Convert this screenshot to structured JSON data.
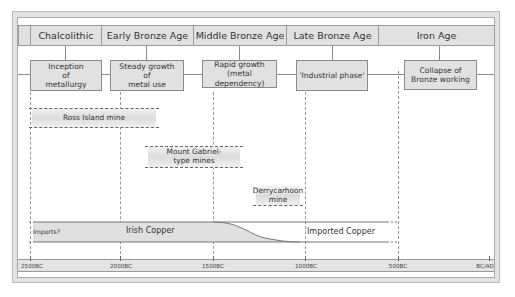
{
  "periods": [
    {
      "label": "Chalcolithic"
    },
    {
      "label": "Early Bronze Age"
    },
    {
      "label": "Middle Bronze Age"
    },
    {
      "label": "Late Bronze Age"
    },
    {
      "label": "Iron Age"
    }
  ],
  "phases": [
    {
      "label": "Inception\nof\nmetallurgy"
    },
    {
      "label": "Steady growth\nof\nmetal use"
    },
    {
      "label": "Rapid growth\n(metal dependency)"
    },
    {
      "label": "'Industrial phase'"
    },
    {
      "label": "Collapse of\nBronze working"
    }
  ],
  "mines": [
    {
      "label": "Ross Island mine"
    },
    {
      "label": "Mount Gabriel-\ntype mines"
    },
    {
      "label": "Derrycarhoon\nmine"
    }
  ],
  "copper": {
    "imports_label": "Imports?",
    "irish_label": "Irish Copper",
    "imported_label": "Imported Copper"
  },
  "axis": {
    "ticks": [
      "2500BC",
      "2000BC",
      "1500BC",
      "1000BC",
      "500BC",
      "BC/AD"
    ]
  },
  "colors": {
    "box_fill": "#e1e1e1",
    "border": "#8a8a8a",
    "irish_band": "#e0e0e0",
    "frame": "#e2e2e2"
  }
}
